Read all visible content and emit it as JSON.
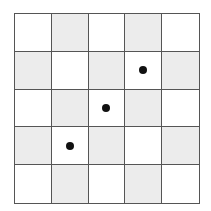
{
  "grid": {
    "rows": 5,
    "cols": 5,
    "colors": {
      "line": "#555555",
      "shaded": "#ececec",
      "unshaded": "#ffffff",
      "dot": "#111111"
    },
    "cells": [
      [
        {
          "shaded": false,
          "dot": false
        },
        {
          "shaded": true,
          "dot": false
        },
        {
          "shaded": false,
          "dot": false
        },
        {
          "shaded": true,
          "dot": false
        },
        {
          "shaded": false,
          "dot": false
        }
      ],
      [
        {
          "shaded": true,
          "dot": false
        },
        {
          "shaded": false,
          "dot": false
        },
        {
          "shaded": true,
          "dot": false
        },
        {
          "shaded": false,
          "dot": true
        },
        {
          "shaded": true,
          "dot": false
        }
      ],
      [
        {
          "shaded": false,
          "dot": false
        },
        {
          "shaded": true,
          "dot": false
        },
        {
          "shaded": false,
          "dot": true
        },
        {
          "shaded": true,
          "dot": false
        },
        {
          "shaded": false,
          "dot": false
        }
      ],
      [
        {
          "shaded": true,
          "dot": false
        },
        {
          "shaded": false,
          "dot": true
        },
        {
          "shaded": true,
          "dot": false
        },
        {
          "shaded": false,
          "dot": false
        },
        {
          "shaded": true,
          "dot": false
        }
      ],
      [
        {
          "shaded": false,
          "dot": false
        },
        {
          "shaded": true,
          "dot": false
        },
        {
          "shaded": false,
          "dot": false
        },
        {
          "shaded": true,
          "dot": false
        },
        {
          "shaded": false,
          "dot": false
        }
      ]
    ]
  }
}
